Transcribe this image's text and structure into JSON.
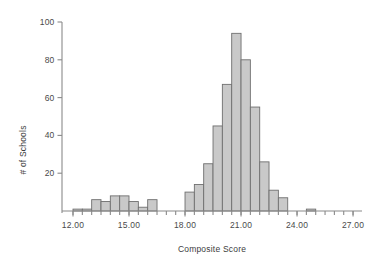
{
  "chart_data": {
    "type": "bar",
    "title": "",
    "subtitle": "",
    "xlabel": "Composite Score",
    "ylabel": "# of Schools",
    "xlim": [
      11.7,
      28.6
    ],
    "ylim": [
      0,
      100
    ],
    "grid": false,
    "legend": null,
    "bin_width": 0.5,
    "x_tick_labels": [
      "12.00",
      "15.00",
      "18.00",
      "21.00",
      "24.00",
      "27.00"
    ],
    "x_tick_values": [
      12,
      15,
      18,
      21,
      24,
      27
    ],
    "y_tick_labels": [
      "20",
      "40",
      "60",
      "80",
      "100"
    ],
    "y_tick_values": [
      20,
      40,
      60,
      80,
      100
    ],
    "x_minor_tick_step": 0.5,
    "bins": [
      {
        "x0": 12.0,
        "x1": 12.5,
        "value": 1
      },
      {
        "x0": 12.5,
        "x1": 13.0,
        "value": 1
      },
      {
        "x0": 13.0,
        "x1": 13.5,
        "value": 6
      },
      {
        "x0": 13.5,
        "x1": 14.0,
        "value": 5
      },
      {
        "x0": 14.0,
        "x1": 14.5,
        "value": 8
      },
      {
        "x0": 14.5,
        "x1": 15.0,
        "value": 8
      },
      {
        "x0": 15.0,
        "x1": 15.5,
        "value": 5
      },
      {
        "x0": 15.5,
        "x1": 16.0,
        "value": 2
      },
      {
        "x0": 16.0,
        "x1": 16.5,
        "value": 6
      },
      {
        "x0": 16.5,
        "x1": 17.0,
        "value": 0
      },
      {
        "x0": 17.0,
        "x1": 17.5,
        "value": 0
      },
      {
        "x0": 17.5,
        "x1": 18.0,
        "value": 0
      },
      {
        "x0": 18.0,
        "x1": 18.5,
        "value": 10
      },
      {
        "x0": 18.5,
        "x1": 19.0,
        "value": 14
      },
      {
        "x0": 19.0,
        "x1": 19.5,
        "value": 25
      },
      {
        "x0": 19.5,
        "x1": 20.0,
        "value": 45
      },
      {
        "x0": 20.0,
        "x1": 20.5,
        "value": 67
      },
      {
        "x0": 20.5,
        "x1": 21.0,
        "value": 94
      },
      {
        "x0": 21.0,
        "x1": 21.5,
        "value": 80
      },
      {
        "x0": 21.5,
        "x1": 22.0,
        "value": 55
      },
      {
        "x0": 22.0,
        "x1": 22.5,
        "value": 26
      },
      {
        "x0": 22.5,
        "x1": 23.0,
        "value": 11
      },
      {
        "x0": 23.0,
        "x1": 23.5,
        "value": 7
      },
      {
        "x0": 23.5,
        "x1": 24.0,
        "value": 0
      },
      {
        "x0": 24.0,
        "x1": 24.5,
        "value": 0
      },
      {
        "x0": 24.5,
        "x1": 25.0,
        "value": 1
      }
    ],
    "categories": [
      "12.00-12.50",
      "12.50-13.00",
      "13.00-13.50",
      "13.50-14.00",
      "14.00-14.50",
      "14.50-15.00",
      "15.00-15.50",
      "15.50-16.00",
      "16.00-16.50",
      "16.50-17.00",
      "17.00-17.50",
      "17.50-18.00",
      "18.00-18.50",
      "18.50-19.00",
      "19.00-19.50",
      "19.50-20.00",
      "20.00-20.50",
      "20.50-21.00",
      "21.00-21.50",
      "21.50-22.00",
      "22.00-22.50",
      "22.50-23.00",
      "23.00-23.50",
      "23.50-24.00",
      "24.00-24.50",
      "24.50-25.00"
    ],
    "values": [
      1,
      1,
      6,
      5,
      8,
      8,
      5,
      2,
      6,
      0,
      0,
      0,
      10,
      14,
      25,
      45,
      67,
      94,
      80,
      55,
      26,
      11,
      7,
      0,
      0,
      1
    ],
    "colors": {
      "bar_fill": "#c9c9c9",
      "bar_stroke": "#6f6f6f",
      "axis": "#8a8a8a",
      "text": "#3d3d3d",
      "background": "#ffffff"
    }
  },
  "plot_geometry": {
    "left": 62,
    "right": 362,
    "baseline_y": 211,
    "top_y": 22,
    "x_at_12": 73,
    "px_per_x_unit": 18.67
  }
}
